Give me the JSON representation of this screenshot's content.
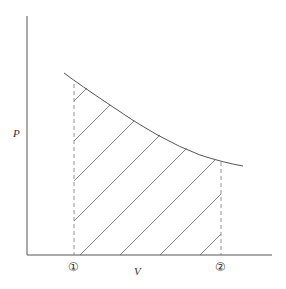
{
  "diagram": {
    "type": "P-V diagram, work done (shaded area under curve)",
    "y_axis_label": "P",
    "x_axis_label": "V",
    "state_labels": [
      "①",
      "②"
    ],
    "colors": {
      "line": "#555555",
      "hatch": "#666666",
      "background": "#ffffff"
    }
  }
}
